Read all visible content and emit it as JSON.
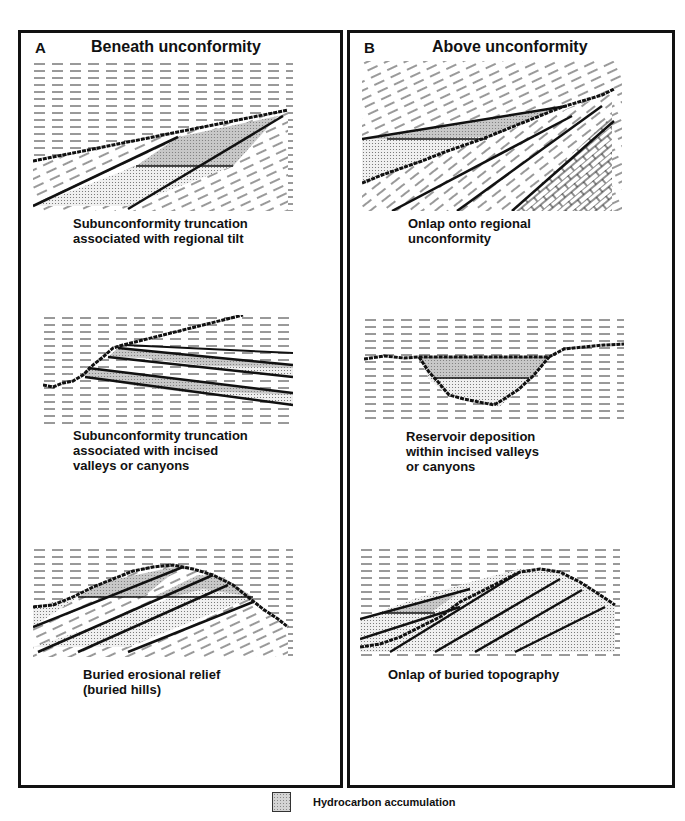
{
  "panels": {
    "a": {
      "letter": "A",
      "title": "Beneath unconformity",
      "figures": [
        {
          "caption": "Subunconformity truncation\nassociated with regional tilt"
        },
        {
          "caption": "Subunconformity truncation\nassociated with incised\nvalleys or canyons"
        },
        {
          "caption": "Buried erosional relief\n(buried hills)"
        }
      ]
    },
    "b": {
      "letter": "B",
      "title": "Above unconformity",
      "figures": [
        {
          "caption": "Onlap onto regional\nunconformity"
        },
        {
          "caption": "Reservoir deposition\nwithin incised valleys\nor canyons"
        },
        {
          "caption": "Onlap of buried topography"
        }
      ]
    }
  },
  "legend": {
    "label": "Hydrocarbon accumulation",
    "swatch_color": "#d4d4d4"
  },
  "colors": {
    "line": "#111111",
    "hydrocarbon_fill": "#c8c8c8",
    "sand_fill": "#e6e6e6"
  }
}
